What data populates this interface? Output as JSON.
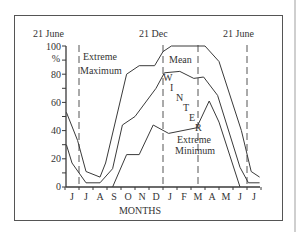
{
  "chart_data": {
    "type": "line",
    "title": "",
    "xlabel": "MONTHS",
    "ylabel": "%",
    "ylim": [
      0,
      100
    ],
    "yticks": [
      0,
      20,
      40,
      60,
      80,
      100
    ],
    "ytick_minor": [
      10,
      30,
      50,
      70,
      90
    ],
    "categories": [
      "J",
      "J",
      "A",
      "S",
      "O",
      "N",
      "D",
      "J",
      "F",
      "M",
      "A",
      "M",
      "J",
      "J"
    ],
    "grid": false,
    "markers": [
      {
        "label": "21 June",
        "x_index": 0.5
      },
      {
        "label": "21 Dec",
        "x_index": 6.5
      },
      {
        "label": "21 June",
        "x_index": 12.5
      }
    ],
    "marker_at_M": {
      "x_index": 9
    },
    "series": [
      {
        "name": "Extreme Maximum",
        "points": [
          [
            -0.4,
            53
          ],
          [
            0.4,
            33
          ],
          [
            1.0,
            11
          ],
          [
            2.0,
            7
          ],
          [
            2.4,
            17
          ],
          [
            3.9,
            80
          ],
          [
            4.8,
            86
          ],
          [
            5.9,
            86
          ],
          [
            6.5,
            96
          ],
          [
            7.1,
            100
          ],
          [
            9.5,
            100
          ],
          [
            10.5,
            89
          ],
          [
            12.1,
            40
          ],
          [
            12.8,
            11
          ],
          [
            13.4,
            7
          ]
        ]
      },
      {
        "name": "Mean",
        "points": [
          [
            -0.4,
            30
          ],
          [
            0.0,
            17
          ],
          [
            1.0,
            3
          ],
          [
            2.0,
            3
          ],
          [
            2.9,
            13
          ],
          [
            3.6,
            44
          ],
          [
            4.5,
            50
          ],
          [
            6.0,
            70
          ],
          [
            6.6,
            81
          ],
          [
            7.7,
            82
          ],
          [
            8.7,
            77
          ],
          [
            9.4,
            78
          ],
          [
            10.4,
            65
          ],
          [
            12.0,
            14
          ],
          [
            12.6,
            3
          ],
          [
            13.4,
            3
          ]
        ]
      },
      {
        "name": "Extreme Minimum",
        "points": [
          [
            2.9,
            0
          ],
          [
            3.9,
            23
          ],
          [
            4.8,
            23
          ],
          [
            5.8,
            44
          ],
          [
            6.9,
            38
          ],
          [
            8.9,
            42
          ],
          [
            9.8,
            61
          ],
          [
            10.5,
            46
          ],
          [
            12.0,
            0
          ]
        ]
      }
    ],
    "annotations": [
      {
        "text": "Extreme",
        "near": "Extreme Maximum"
      },
      {
        "text": "Maximum",
        "near": "Extreme Maximum"
      },
      {
        "text": "Mean",
        "near": "Mean"
      },
      {
        "text": "W",
        "near": "winter"
      },
      {
        "text": "I",
        "near": "winter"
      },
      {
        "text": "N",
        "near": "winter"
      },
      {
        "text": "T",
        "near": "winter"
      },
      {
        "text": "E",
        "near": "winter"
      },
      {
        "text": "R",
        "near": "winter"
      },
      {
        "text": "Extreme",
        "near": "Extreme Minimum"
      },
      {
        "text": "Minimum",
        "near": "Extreme Minimum"
      }
    ],
    "legend_position": "inline labels"
  },
  "labels": {
    "marker_june_1": "21 June",
    "marker_dec": "21 Dec",
    "marker_june_2": "21 June",
    "y_100": "100",
    "y_pct": "%",
    "y_80": "80",
    "y_60": "60",
    "y_40": "40",
    "y_20": "20",
    "y_0": "0",
    "ext_max_1": "Extreme",
    "ext_max_2": "Maximum",
    "mean": "Mean",
    "winter": [
      "W",
      "I",
      "N",
      "T",
      "E",
      "R"
    ],
    "ext_min_1": "Extreme",
    "ext_min_2": "Minimum",
    "xlabel": "MONTHS",
    "months": [
      "J",
      "J",
      "A",
      "S",
      "O",
      "N",
      "D",
      "J",
      "F",
      "M",
      "A",
      "M",
      "J",
      "J"
    ]
  },
  "colors": {
    "line": "#3a3a3a",
    "dash": "#555555",
    "frame": "#555555"
  }
}
